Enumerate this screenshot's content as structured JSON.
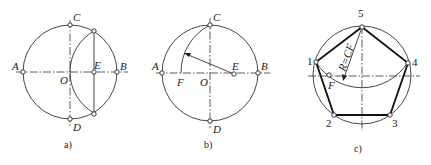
{
  "figure": {
    "panels": [
      {
        "id": "a",
        "caption": "a)",
        "labels": {
          "A": "A",
          "B": "B",
          "C": "C",
          "D": "D",
          "O": "O",
          "E": "E"
        }
      },
      {
        "id": "b",
        "caption": "b)",
        "labels": {
          "A": "A",
          "B": "B",
          "C": "C",
          "D": "D",
          "O": "O",
          "E": "E",
          "F": "F"
        }
      },
      {
        "id": "c",
        "caption": "c)",
        "labels": {
          "v1": "1",
          "v2": "2",
          "v3": "3",
          "v4": "4",
          "v5": "5",
          "F": "F",
          "radius": "R=CF"
        }
      }
    ]
  },
  "colors": {
    "line": "#333333",
    "polygon": "#111111",
    "background": "#ffffff"
  }
}
